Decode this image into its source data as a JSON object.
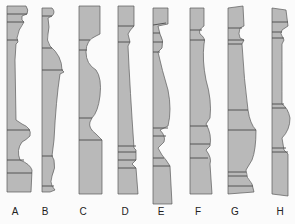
{
  "diagram": {
    "fill_color": "#b9b9b9",
    "stroke_color": "#5a5a5a",
    "background": "#fbfbfb",
    "profiles": [
      {
        "label": "A"
      },
      {
        "label": "B"
      },
      {
        "label": "C"
      },
      {
        "label": "D"
      },
      {
        "label": "E"
      },
      {
        "label": "F"
      },
      {
        "label": "G"
      },
      {
        "label": "H"
      }
    ]
  }
}
